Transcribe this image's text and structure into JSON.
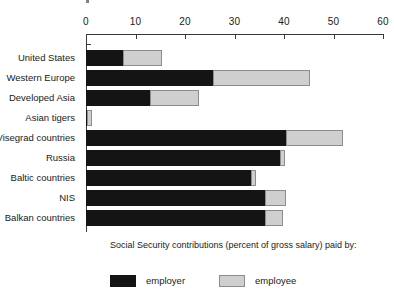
{
  "chart_data": {
    "type": "bar",
    "orientation": "horizontal",
    "stacked": true,
    "title": "",
    "xlabel": "",
    "ylabel": "",
    "xlim": [
      0,
      60
    ],
    "xticks": [
      0,
      10,
      20,
      30,
      40,
      50,
      60
    ],
    "xtick_labels": [
      "0",
      "10",
      "20",
      "30",
      "40",
      "50",
      "60"
    ],
    "grid": false,
    "legend_position": "bottom",
    "categories": [
      "United States",
      "Western Europe",
      "Developed Asia",
      "Asian tigers",
      "Visegrad countries",
      "Russia",
      "Baltic countries",
      "NIS",
      "Balkan countries"
    ],
    "series": [
      {
        "name": "employer",
        "color": "#141414",
        "values": [
          7.4,
          25.6,
          12.9,
          0.3,
          40.4,
          39.1,
          33.3,
          36.2,
          36.2
        ]
      },
      {
        "name": "employee",
        "color": "#cfcfcf",
        "values": [
          8.0,
          19.6,
          9.9,
          1.0,
          11.5,
          1.1,
          1.0,
          4.2,
          3.6
        ]
      }
    ],
    "totals": [
      15.4,
      45.2,
      22.8,
      1.3,
      51.9,
      40.2,
      34.3,
      40.4,
      39.8
    ],
    "caption": "Social Security contributions (percent of gross salary) paid by:",
    "legend": [
      {
        "label": "employer",
        "swatch": "employer"
      },
      {
        "label": "employee",
        "swatch": "employee"
      }
    ]
  }
}
